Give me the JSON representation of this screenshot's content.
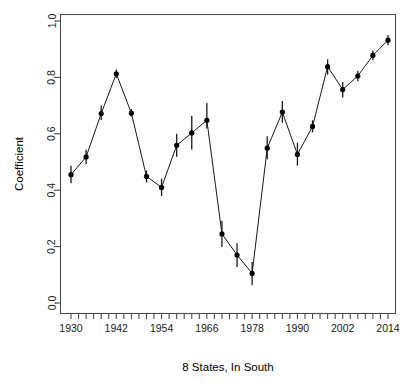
{
  "chart_data": {
    "type": "line",
    "title": "",
    "xlabel": "8 States, In South",
    "ylabel": "Coefficient",
    "xlim": [
      1928,
      2016
    ],
    "ylim": [
      0.0,
      1.0
    ],
    "grid": false,
    "legend": "none",
    "error_bars": "vertical",
    "x_tick_labels": [
      "1930",
      "1942",
      "1954",
      "1966",
      "1978",
      "1990",
      "2002",
      "2014"
    ],
    "x_tick_values": [
      1930,
      1942,
      1954,
      1966,
      1978,
      1990,
      2002,
      2014
    ],
    "x_minor_tick_values": [
      1930,
      1932,
      1934,
      1936,
      1938,
      1940,
      1942,
      1944,
      1946,
      1948,
      1950,
      1952,
      1954,
      1956,
      1958,
      1960,
      1962,
      1964,
      1966,
      1968,
      1970,
      1972,
      1974,
      1976,
      1978,
      1980,
      1982,
      1984,
      1986,
      1988,
      1990,
      1992,
      1994,
      1996,
      1998,
      2000,
      2002,
      2004,
      2006,
      2008,
      2010,
      2012,
      2014
    ],
    "y_tick_labels": [
      "0.0",
      "0.2",
      "0.4",
      "0.6",
      "0.8",
      "1.0"
    ],
    "y_tick_values": [
      0.0,
      0.2,
      0.4,
      0.6,
      0.8,
      1.0
    ],
    "x": [
      1930,
      1934,
      1938,
      1942,
      1946,
      1950,
      1954,
      1958,
      1962,
      1966,
      1970,
      1974,
      1978,
      1982,
      1986,
      1990,
      1994,
      1998,
      2002,
      2006,
      2010,
      2014
    ],
    "values": [
      0.455,
      0.518,
      0.672,
      0.813,
      0.673,
      0.449,
      0.41,
      0.559,
      0.603,
      0.648,
      0.245,
      0.17,
      0.105,
      0.549,
      0.677,
      0.527,
      0.626,
      0.838,
      0.757,
      0.805,
      0.878,
      0.932
    ],
    "y_err_low": [
      0.425,
      0.492,
      0.649,
      0.798,
      0.661,
      0.427,
      0.379,
      0.519,
      0.544,
      0.619,
      0.199,
      0.128,
      0.063,
      0.51,
      0.639,
      0.487,
      0.605,
      0.81,
      0.729,
      0.786,
      0.861,
      0.914
    ],
    "y_err_high": [
      0.487,
      0.543,
      0.7,
      0.828,
      0.688,
      0.47,
      0.441,
      0.6,
      0.664,
      0.709,
      0.292,
      0.212,
      0.145,
      0.591,
      0.716,
      0.568,
      0.648,
      0.864,
      0.784,
      0.824,
      0.895,
      0.95
    ],
    "colors": {
      "line": "#1a1a1a",
      "marker": "#000000",
      "axis": "#4d4d4d",
      "background": "#ffffff"
    }
  }
}
